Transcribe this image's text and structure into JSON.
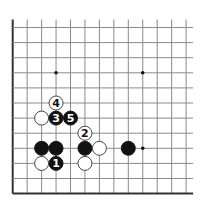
{
  "diagram": {
    "type": "go-board-fragment",
    "grid": {
      "cols": 13,
      "rows": 12,
      "x0": 12.7,
      "dx": 14.45,
      "y0": 27.5,
      "dy": 15.1,
      "line_top_extend": 8,
      "line_right_extend": 7,
      "edges": [
        "left",
        "bottom"
      ],
      "line_color": "#8a8a8a",
      "edge_color": "#333333"
    },
    "star_points": [
      {
        "col": 3,
        "row": 3
      },
      {
        "col": 9,
        "row": 3
      },
      {
        "col": 9,
        "row": 8
      }
    ],
    "stones": [
      {
        "color": "white",
        "col": 3,
        "row": 5,
        "label": "4"
      },
      {
        "color": "white",
        "col": 2,
        "row": 6,
        "label": ""
      },
      {
        "color": "black",
        "col": 3,
        "row": 6,
        "label": "3"
      },
      {
        "color": "black",
        "col": 4,
        "row": 6,
        "label": "5"
      },
      {
        "color": "white",
        "col": 5,
        "row": 7,
        "label": "2"
      },
      {
        "color": "black",
        "col": 2,
        "row": 8,
        "label": ""
      },
      {
        "color": "black",
        "col": 3,
        "row": 8,
        "label": ""
      },
      {
        "color": "black",
        "col": 5,
        "row": 8,
        "label": ""
      },
      {
        "color": "white",
        "col": 6,
        "row": 8,
        "label": ""
      },
      {
        "color": "black",
        "col": 8,
        "row": 8,
        "label": ""
      },
      {
        "color": "white",
        "col": 2,
        "row": 9,
        "label": ""
      },
      {
        "color": "black",
        "col": 3,
        "row": 9,
        "label": "1"
      },
      {
        "color": "white",
        "col": 5,
        "row": 9,
        "label": ""
      }
    ],
    "stone_radius": 7,
    "colors": {
      "black_stone": "#111111",
      "white_stone": "#ffffff",
      "white_stone_border": "#333333",
      "black_label": "#ffffff",
      "white_label": "#111111",
      "star_point": "#111111"
    }
  }
}
